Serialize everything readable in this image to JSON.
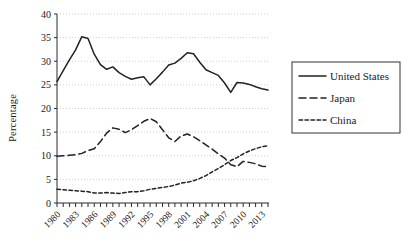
{
  "chart_data": {
    "type": "line",
    "title": "",
    "xlabel": "",
    "ylabel": "Percentage",
    "ylim": [
      0,
      40
    ],
    "yticks": [
      0,
      5,
      10,
      15,
      20,
      25,
      30,
      35,
      40
    ],
    "grid": true,
    "legend_position": "right",
    "x": [
      1980,
      1981,
      1982,
      1983,
      1984,
      1985,
      1986,
      1987,
      1988,
      1989,
      1990,
      1991,
      1992,
      1993,
      1994,
      1995,
      1996,
      1997,
      1998,
      1999,
      2000,
      2001,
      2002,
      2003,
      2004,
      2005,
      2006,
      2007,
      2008,
      2009,
      2010,
      2011,
      2012,
      2013,
      2014
    ],
    "xtick_labels": [
      "1980",
      "1983",
      "1986",
      "1989",
      "1992",
      "1995",
      "1998",
      "2001",
      "2004",
      "2007",
      "2010",
      "2013"
    ],
    "xtick_values": [
      1980,
      1983,
      1986,
      1989,
      1992,
      1995,
      1998,
      2001,
      2004,
      2007,
      2010,
      2013
    ],
    "series": [
      {
        "name": "United States",
        "style": "solid",
        "values": [
          25.7,
          28.0,
          30.3,
          32.4,
          35.2,
          34.8,
          31.5,
          29.3,
          28.3,
          28.8,
          27.6,
          26.8,
          26.2,
          26.5,
          26.7,
          25.0,
          26.3,
          27.7,
          29.2,
          29.6,
          30.6,
          31.8,
          31.6,
          29.8,
          28.2,
          27.6,
          27.0,
          25.4,
          23.4,
          25.5,
          25.4,
          25.1,
          24.6,
          24.2,
          23.9
        ]
      },
      {
        "name": "Japan",
        "style": "dashed-long",
        "values": [
          9.9,
          10.0,
          10.1,
          10.2,
          10.5,
          11.1,
          11.5,
          13.0,
          14.8,
          15.9,
          15.6,
          14.9,
          15.5,
          16.4,
          17.3,
          17.9,
          17.2,
          15.5,
          13.8,
          13.0,
          14.2,
          14.6,
          14.0,
          13.2,
          12.3,
          11.4,
          10.4,
          9.5,
          8.1,
          7.7,
          8.8,
          8.6,
          8.3,
          7.8,
          7.7
        ]
      },
      {
        "name": "China",
        "style": "dashed-short",
        "values": [
          2.9,
          2.8,
          2.7,
          2.6,
          2.5,
          2.4,
          2.1,
          2.1,
          2.2,
          2.1,
          2.0,
          2.2,
          2.4,
          2.4,
          2.6,
          2.9,
          3.1,
          3.3,
          3.5,
          3.8,
          4.2,
          4.4,
          4.7,
          5.2,
          5.8,
          6.6,
          7.3,
          8.1,
          9.0,
          9.6,
          10.4,
          11.0,
          11.5,
          11.9,
          12.1
        ]
      }
    ]
  },
  "legend": {
    "items": [
      {
        "label": "United States",
        "style": "solid"
      },
      {
        "label": "Japan",
        "style": "dashed-long"
      },
      {
        "label": "China",
        "style": "dashed-short"
      }
    ]
  }
}
